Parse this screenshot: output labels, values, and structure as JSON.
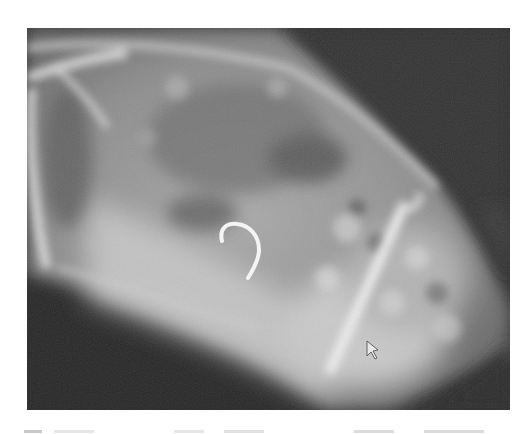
{
  "figure": {
    "type": "radiograph",
    "annotations": [
      {
        "name": "hook-shaped-foreign-body",
        "color": "#f2f2f2"
      },
      {
        "name": "arrow-marker",
        "color": "#e8e8e8"
      }
    ],
    "colors": {
      "background": "#2e2e2e",
      "soft_tissue": "#8a8a8a",
      "bright_tissue": "#d8d8d8",
      "page": "#ffffff"
    }
  },
  "caption": {
    "visible": "partial",
    "text": ""
  }
}
